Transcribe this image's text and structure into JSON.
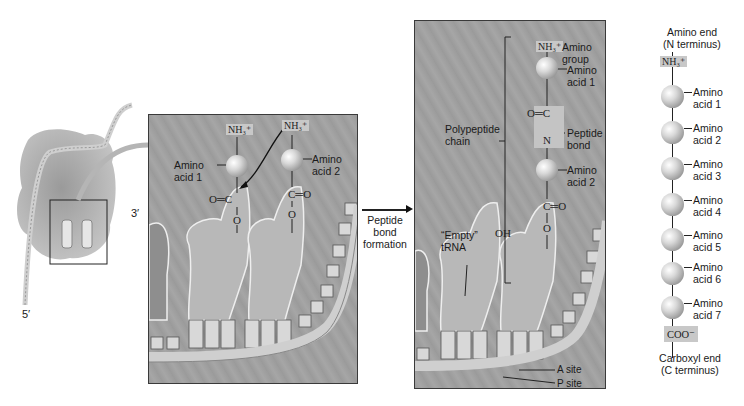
{
  "overview": {
    "label_3prime": "3′",
    "label_5prime": "5′"
  },
  "panel_before": {
    "amino_acid_1": {
      "group": "NH₃⁺",
      "label": "Amino\nacid 1",
      "label_line1": "Amino",
      "label_line2": "acid 1",
      "carbonyl": "O═C",
      "link": "O"
    },
    "amino_acid_2": {
      "group": "NH₃⁺",
      "label_line1": "Amino",
      "label_line2": "acid 2",
      "carbonyl": "C═O",
      "link": "O"
    }
  },
  "transition": {
    "line1": "Peptide",
    "line2": "bond",
    "line3": "formation"
  },
  "panel_after": {
    "amino_group_chem": "NH₃⁺",
    "amino_group_label_1": "Amino",
    "amino_group_label_2": "group",
    "aa1_label_1": "Amino",
    "aa1_label_2": "acid 1",
    "peptide_c": "O═C",
    "peptide_n": "N",
    "peptide_bond_label_1": "Peptide",
    "peptide_bond_label_2": "bond",
    "chain_label_1": "Polypeptide",
    "chain_label_2": "chain",
    "aa2_label_1": "Amino",
    "aa2_label_2": "acid 2",
    "carbonyl": "C═O",
    "link": "O",
    "empty_trna_1": "“Empty”",
    "empty_trna_2": "tRNA",
    "oh": "OH",
    "a_site": "A site",
    "p_site": "P site"
  },
  "chain": {
    "top_label_1": "Amino end",
    "top_label_2": "(N terminus)",
    "n_group": "NH₃⁺",
    "amino_acids": [
      {
        "l1": "Amino",
        "l2": "acid 1"
      },
      {
        "l1": "Amino",
        "l2": "acid 2"
      },
      {
        "l1": "Amino",
        "l2": "acid 3"
      },
      {
        "l1": "Amino",
        "l2": "acid 4"
      },
      {
        "l1": "Amino",
        "l2": "acid 5"
      },
      {
        "l1": "Amino",
        "l2": "acid 6"
      },
      {
        "l1": "Amino",
        "l2": "acid 7"
      }
    ],
    "c_group": "COO⁻",
    "bottom_label_1": "Carboxyl end",
    "bottom_label_2": "(C terminus)"
  }
}
